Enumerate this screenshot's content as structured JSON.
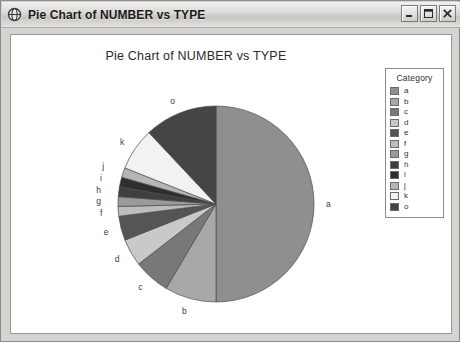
{
  "window": {
    "title": "Pie Chart of NUMBER vs TYPE",
    "icon": "globe-icon",
    "minimize_label": "Minimize",
    "maximize_label": "Maximize",
    "close_label": "Close"
  },
  "legend": {
    "title": "Category",
    "items": [
      {
        "label": "a",
        "color": "#8f8f8f"
      },
      {
        "label": "b",
        "color": "#a8a8a8"
      },
      {
        "label": "c",
        "color": "#787878"
      },
      {
        "label": "d",
        "color": "#c9c9c9"
      },
      {
        "label": "e",
        "color": "#555555"
      },
      {
        "label": "f",
        "color": "#bdbdbd"
      },
      {
        "label": "g",
        "color": "#9a9a9a"
      },
      {
        "label": "h",
        "color": "#3f3f3f"
      },
      {
        "label": "i",
        "color": "#2e2e2e"
      },
      {
        "label": "j",
        "color": "#b5b5b5"
      },
      {
        "label": "k",
        "color": "#f2f2f2"
      },
      {
        "label": "o",
        "color": "#454545"
      }
    ]
  },
  "chart_data": {
    "type": "pie",
    "title": "Pie Chart of NUMBER vs TYPE",
    "xlabel": "",
    "ylabel": "",
    "legend_title": "Category",
    "legend_position": "right",
    "start_angle_deg": 0,
    "direction": "clockwise",
    "categories": [
      "a",
      "b",
      "c",
      "d",
      "e",
      "f",
      "g",
      "h",
      "i",
      "j",
      "k",
      "o"
    ],
    "values": [
      50.0,
      8.5,
      6.0,
      4.5,
      4.0,
      1.6,
      1.6,
      1.6,
      1.6,
      1.6,
      7.0,
      12.0
    ],
    "colors": [
      "#8f8f8f",
      "#a8a8a8",
      "#787878",
      "#c9c9c9",
      "#555555",
      "#bdbdbd",
      "#9a9a9a",
      "#3f3f3f",
      "#2e2e2e",
      "#b5b5b5",
      "#f2f2f2",
      "#454545"
    ],
    "center": {
      "x": 205,
      "y": 169
    },
    "radius": 98,
    "grid": false
  }
}
